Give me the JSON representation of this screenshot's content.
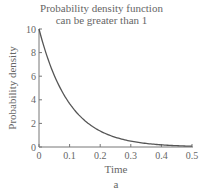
{
  "chart_data": {
    "type": "line",
    "title_lines": [
      "Probability density function",
      "can be greater than 1"
    ],
    "xlabel": "Time",
    "ylabel": "Probability density",
    "caption": "a",
    "xlim": [
      0,
      0.5
    ],
    "ylim": [
      0,
      10
    ],
    "xticks": [
      "0",
      "0.1",
      "0.2",
      "0.3",
      "0.4",
      "0.5"
    ],
    "yticks": [
      "0",
      "2",
      "4",
      "6",
      "8",
      "10"
    ],
    "grid": false,
    "legend": null,
    "series": [
      {
        "name": "10·exp(-10t)",
        "x": [
          0,
          0.05,
          0.1,
          0.15,
          0.2,
          0.25,
          0.3,
          0.35,
          0.4,
          0.45,
          0.5
        ],
        "values": [
          10,
          6.07,
          3.68,
          2.23,
          1.35,
          0.82,
          0.5,
          0.3,
          0.18,
          0.11,
          0.07
        ]
      }
    ],
    "line_color": "#555555"
  }
}
